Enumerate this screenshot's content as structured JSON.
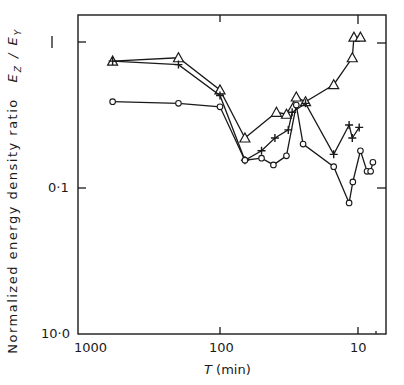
{
  "chart_data": {
    "type": "line",
    "title": "",
    "xlabel": "T (min)",
    "ylabel": "Normalized energy density ratio E_Z / E_Y",
    "xscale": "log",
    "yscale": "log",
    "x_reversed": true,
    "xlim": [
      1000,
      7
    ],
    "ylim": [
      1.25,
      0.01
    ],
    "y_reversed_log": true,
    "x_ticks": [
      "1000",
      "100",
      "10"
    ],
    "y_ticks": [
      "1",
      "0·1",
      "10·0"
    ],
    "grid": false,
    "legend": "none",
    "series": [
      {
        "name": "triangle",
        "marker": "triangle",
        "x": [
          600,
          200,
          100,
          66,
          39,
          33,
          28,
          24,
          15,
          11,
          10.7,
          9.6
        ],
        "y": [
          0.74,
          0.78,
          0.47,
          0.22,
          0.33,
          0.32,
          0.42,
          0.39,
          0.51,
          0.78,
          1.08,
          1.08
        ]
      },
      {
        "name": "plus",
        "marker": "plus",
        "x": [
          600,
          200,
          100,
          66,
          50,
          40,
          32,
          30,
          24,
          15,
          11.6,
          11,
          9.8
        ],
        "y": [
          0.74,
          0.7,
          0.43,
          0.155,
          0.18,
          0.22,
          0.25,
          0.33,
          0.38,
          0.17,
          0.27,
          0.22,
          0.26
        ]
      },
      {
        "name": "circle",
        "marker": "circle",
        "x": [
          600,
          200,
          100,
          66,
          50,
          41,
          33,
          28,
          25,
          15,
          11.6,
          10.9,
          9.6,
          8.6,
          8.1,
          7.8
        ],
        "y": [
          0.39,
          0.38,
          0.36,
          0.155,
          0.16,
          0.144,
          0.166,
          0.37,
          0.2,
          0.14,
          0.079,
          0.11,
          0.18,
          0.13,
          0.13,
          0.15
        ]
      }
    ]
  },
  "labels": {
    "ylabel_text": "Normalized energy density ratio",
    "ylabel_symbol_num": "E",
    "ylabel_sub_num": "Z",
    "ylabel_sep": " / ",
    "ylabel_symbol_den": "E",
    "ylabel_sub_den": "Y",
    "xlabel_symbol": "T",
    "xlabel_unit": " (min)",
    "xtick_1000": "1000",
    "xtick_100": "100",
    "xtick_10": "10",
    "ytick_1": "1",
    "ytick_01": "0·1",
    "ytick_001": "10·0"
  },
  "colors": {
    "ink": "#1a1a1a",
    "background": "#ffffff"
  }
}
